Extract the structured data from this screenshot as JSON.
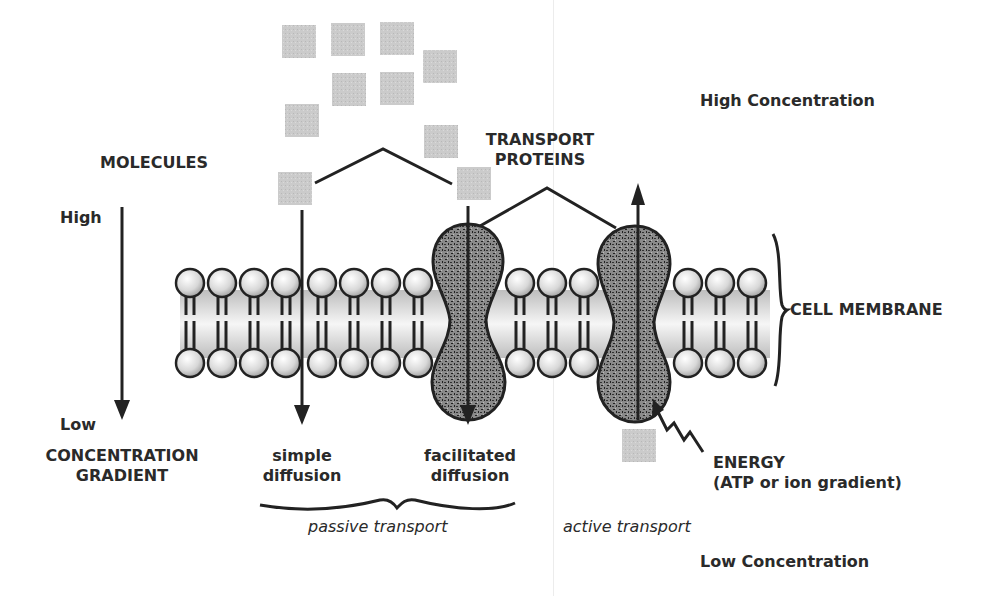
{
  "labels": {
    "high_concentration": "High Concentration",
    "low_concentration": "Low Concentration",
    "molecules": "MOLECULES",
    "transport_proteins_line1": "TRANSPORT",
    "transport_proteins_line2": "PROTEINS",
    "gradient_high": "High",
    "gradient_low": "Low",
    "gradient_title_line1": "CONCENTRATION",
    "gradient_title_line2": "GRADIENT",
    "cell_membrane": "CELL MEMBRANE",
    "simple_diffusion_line1": "simple",
    "simple_diffusion_line2": "diffusion",
    "facilitated_diffusion_line1": "facilitated",
    "facilitated_diffusion_line2": "diffusion",
    "passive_transport": "passive transport",
    "active_transport": "active transport",
    "energy_line1": "ENERGY",
    "energy_line2": "(ATP or ion gradient)"
  },
  "colors": {
    "molecule": "#c8c8c8",
    "protein": "#6e6e6e",
    "head": "#e8e8e8",
    "outline": "#2a2a2a",
    "membrane_core": "#dcdcdc"
  },
  "molecules_above": [
    {
      "x": 282,
      "y": 25
    },
    {
      "x": 331,
      "y": 23
    },
    {
      "x": 380,
      "y": 22
    },
    {
      "x": 423,
      "y": 50
    },
    {
      "x": 332,
      "y": 73
    },
    {
      "x": 380,
      "y": 72
    },
    {
      "x": 285,
      "y": 104
    },
    {
      "x": 424,
      "y": 125
    },
    {
      "x": 278,
      "y": 172
    },
    {
      "x": 457,
      "y": 167
    }
  ],
  "molecules_below": [
    {
      "x": 622,
      "y": 429
    }
  ],
  "membrane": {
    "top_heads_y": 283,
    "bottom_heads_y": 363,
    "segments": [
      {
        "from": 190,
        "count": 4
      },
      {
        "from": 322,
        "count": 4
      },
      {
        "from": 520,
        "count": 3
      },
      {
        "from": 688,
        "count": 3
      }
    ]
  }
}
